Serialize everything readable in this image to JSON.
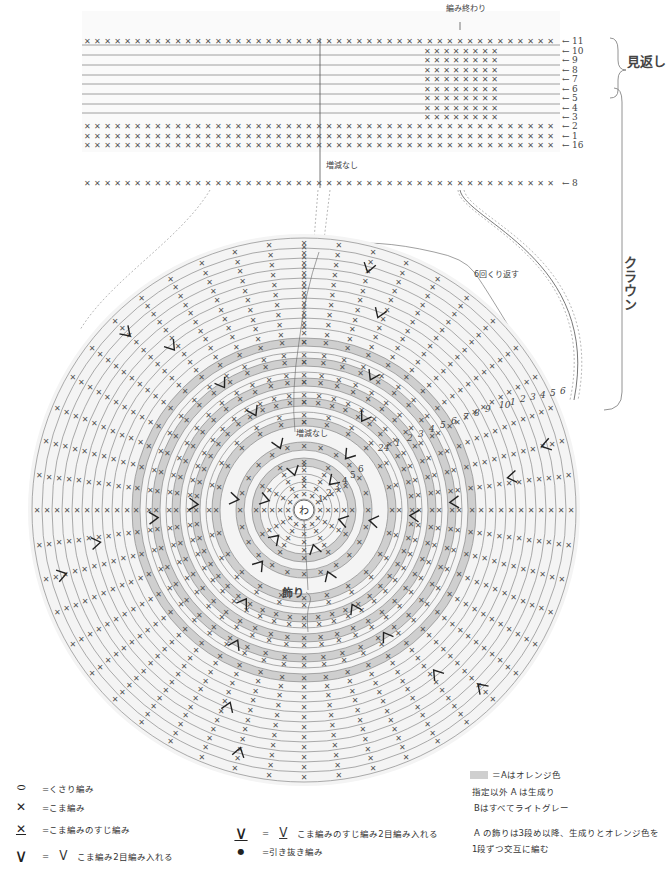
{
  "top_band": {
    "end_label": "編み終わり",
    "no_change_label": "増減なし",
    "rows_right_labels": [
      "11",
      "10",
      "9",
      "8",
      "7",
      "6",
      "5",
      "4",
      "3",
      "2",
      "1",
      "16"
    ],
    "separate_row_label": "8",
    "mikaeshi_label": "見返し",
    "crown_label": "クラウン"
  },
  "crown": {
    "repeat_label": "6回くり返す",
    "no_change_label": "増減なし",
    "center_label": "わ",
    "decoration_label": "飾り",
    "inner_round_numbers": [
      "1",
      "2",
      "3",
      "4",
      "5",
      "6"
    ],
    "outer_round_numbers": [
      "24",
      "1",
      "2",
      "3",
      "4",
      "5",
      "6",
      "7",
      "8",
      "9",
      "10",
      "1",
      "2",
      "3",
      "4",
      "5",
      "6",
      "7"
    ]
  },
  "legend": {
    "items": [
      {
        "symbol": "chain-icon",
        "glyph": "⬭",
        "text": "=くさり編み"
      },
      {
        "symbol": "single-crochet-icon",
        "glyph": "✕",
        "text": "=こま編み"
      },
      {
        "symbol": "back-loop-sc-icon",
        "glyph": "X̲",
        "text": "=こま編みのすじ編み"
      },
      {
        "symbol": "sc-increase-icon",
        "glyph": "∨",
        "eq": "=",
        "glyph2": "ᐯ",
        "text": "こま編み2目編み入れる"
      },
      {
        "symbol": "back-loop-increase-icon",
        "glyph": "∨",
        "eq": "=",
        "glyph2": "ᐯ",
        "text": "こま編みのすじ編み2目編み入れる"
      },
      {
        "symbol": "slip-stitch-icon",
        "glyph": "●",
        "text": "=引き抜き編み"
      }
    ]
  },
  "notes": {
    "color_a": "＝Aはオレンジ色",
    "default_a": "指定以外 A は生成り",
    "color_b": "Bはすべてライトグレー",
    "decoration_line1": "A の飾りは3段め以降、生成りとオレンジ色を",
    "decoration_line2": "1段ずつ交互に編む"
  },
  "colors": {
    "orange_band": "#cfcfcf",
    "light_band": "#f2f2f2",
    "line": "#777777",
    "stitch": "#555555"
  }
}
